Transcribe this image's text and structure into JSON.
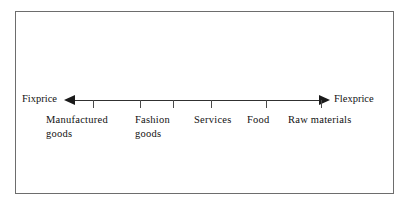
{
  "figure": {
    "type": "continuum-scale-diagram",
    "axis": {
      "left_endpoint_label": "Fixprice",
      "right_endpoint_label": "Flexprice",
      "left_arrow_icon": "arrow-left-icon",
      "right_arrow_icon": "arrow-right-icon",
      "tick_count": 6,
      "tick_positions_px": [
        77,
        124,
        157,
        195,
        250,
        305
      ]
    },
    "categories": [
      {
        "label": "Manufactured\ngoods",
        "left_px": 30
      },
      {
        "label": "Fashion\ngoods",
        "left_px": 119
      },
      {
        "label": "Services",
        "left_px": 178
      },
      {
        "label": "Food",
        "left_px": 231
      },
      {
        "label": "Raw materials",
        "left_px": 272
      }
    ],
    "colors": {
      "frame": "#6d6d6d",
      "axis": "#303030",
      "arrow": "#1a1a1a",
      "tick": "#4a4a4a",
      "text": "#111111",
      "background": "#ffffff"
    }
  }
}
